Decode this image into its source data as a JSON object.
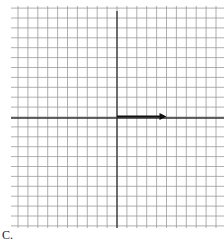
{
  "figure": {
    "label": "C.",
    "grid": {
      "x0": 11,
      "y0": 6,
      "x1": 224,
      "y1": 228,
      "cell": 9.9,
      "line_color": "#9a9a9a",
      "axis_color": "#333333"
    },
    "axes": {
      "vertical_x": 117,
      "horizontal_y": 117
    },
    "vector": {
      "from": [
        0,
        0
      ],
      "to": [
        5,
        0
      ],
      "color": "#111111",
      "description": "arrow pointing right from origin, length 5 units"
    }
  }
}
